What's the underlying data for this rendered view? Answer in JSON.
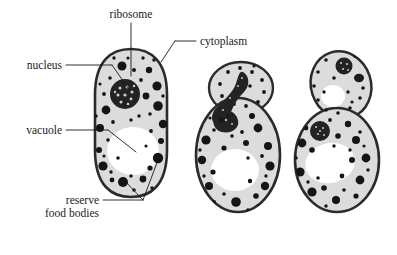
{
  "figure": {
    "background_color": "#ffffff",
    "outline_color": "#2b2b2b",
    "cytoplasm_color": "#dcdcdc",
    "granule_color": "#1a1a1a",
    "vacuole_color": "#ffffff",
    "nucleus_color": "#242424"
  },
  "labels": {
    "ribosome": "ribosome",
    "cytoplasm": "cytoplasm",
    "nucleus": "nucleus",
    "vacuole": "vacuole",
    "reserve": "reserve",
    "food_bodies": "food bodies"
  },
  "cells": [
    {
      "name": "mother-cell",
      "stage": "single cell",
      "has_nucleus": true,
      "has_vacuole": true,
      "has_bud": false
    },
    {
      "name": "budding-cell",
      "stage": "early bud with dividing nucleus",
      "has_nucleus": true,
      "has_vacuole": true,
      "has_bud": true
    },
    {
      "name": "late-budding-cell",
      "stage": "late bud, daughter cell with own nucleus and vacuole",
      "has_nucleus": true,
      "has_vacuole": true,
      "has_bud": true
    }
  ]
}
